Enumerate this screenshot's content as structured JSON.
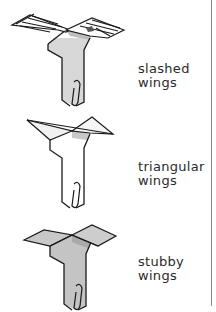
{
  "figures": [
    {
      "id": "slashed",
      "label_line1": "slashed",
      "label_line2": "wings"
    },
    {
      "id": "triangular",
      "label_line1": "triangular",
      "label_line2": "wings"
    },
    {
      "id": "stubby",
      "label_line1": "stubby",
      "label_line2": "wings"
    }
  ],
  "colors": {
    "ink": "#1a1a1a",
    "paper": "#ffffff",
    "shade_light": "#e6e6e6",
    "shade_mid": "#c9c9c9",
    "shade_dark": "#b0b0b0",
    "rule": "#8a8a8a"
  }
}
